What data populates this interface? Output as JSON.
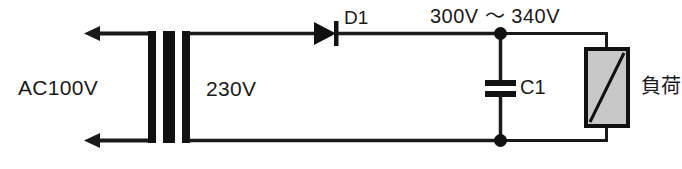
{
  "figure": {
    "name": "half-wave-rectifier-circuit",
    "type": "electrical-schematic",
    "background_color": "#ffffff",
    "line_color": "#1a1a1a"
  },
  "labels": {
    "ac_input": "AC100V",
    "secondary_voltage": "230V",
    "diode": "D1",
    "rail_voltage": "300V 〜 340V",
    "capacitor": "C1",
    "load": "負荷"
  },
  "components": {
    "transformer": {
      "name": "transformer",
      "bar_color": "#111111",
      "bars": 3
    },
    "diode": {
      "name": "diode-d1",
      "orientation": "left-to-right",
      "fill": "#111111"
    },
    "capacitor": {
      "name": "capacitor-c1",
      "plates": 2,
      "plate_color": "#111111"
    },
    "load": {
      "name": "load-block",
      "fill": "#c8c8c8",
      "stroke": "#111111",
      "diagonal": true
    },
    "arrows": {
      "name": "ac-source-arrows",
      "count": 2,
      "direction": "left"
    },
    "junctions": {
      "name": "junction-dots",
      "count": 2,
      "color": "#111111"
    }
  }
}
